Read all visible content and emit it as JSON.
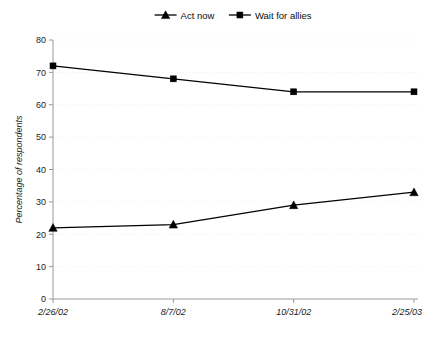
{
  "chart_data": {
    "type": "line",
    "title": "",
    "xlabel": "",
    "ylabel": "Percentage of respondents",
    "categories": [
      "2/26/02",
      "8/7/02",
      "10/31/02",
      "2/25/03"
    ],
    "ylim": [
      0,
      80
    ],
    "yticks": [
      0,
      10,
      20,
      30,
      40,
      50,
      60,
      70,
      80
    ],
    "grid": "faint-horizontal-dotted",
    "legend_position": "top-center",
    "series": [
      {
        "name": "Act now",
        "marker": "triangle",
        "color": "#000000",
        "values": [
          22,
          23,
          29,
          33
        ]
      },
      {
        "name": "Wait for allies",
        "marker": "square",
        "color": "#000000",
        "values": [
          72,
          68,
          64,
          64
        ]
      }
    ]
  },
  "legend": {
    "items": [
      {
        "label": "Act now",
        "marker": "triangle"
      },
      {
        "label": "Wait for allies",
        "marker": "square"
      }
    ]
  },
  "axes": {
    "y_tick_labels": [
      "0",
      "10",
      "20",
      "30",
      "40",
      "50",
      "60",
      "70",
      "80"
    ],
    "x_tick_labels": [
      "2/26/02",
      "8/7/02",
      "10/31/02",
      "2/25/03"
    ],
    "y_axis_title": "Percentage of respondents"
  }
}
